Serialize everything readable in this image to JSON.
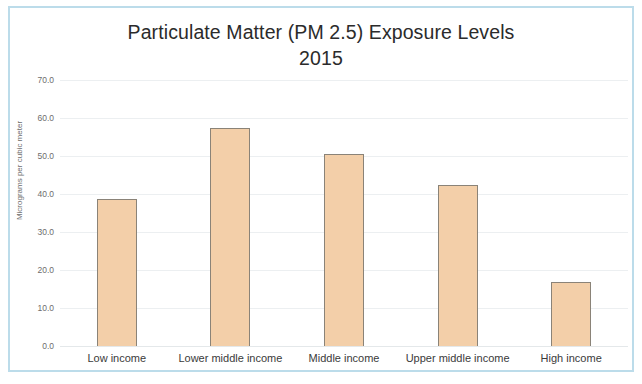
{
  "chart_data": {
    "type": "bar",
    "title": "Particulate Matter (PM  2.5) Exposure Levels",
    "subtitle": "2015",
    "categories": [
      "Low income",
      "Lower middle income",
      "Middle income",
      "Upper middle income",
      "High income"
    ],
    "values": [
      38.8,
      57.5,
      50.5,
      42.3,
      16.8
    ],
    "xlabel": "",
    "ylabel": "Micrograms per cubic meter",
    "ylim": [
      0.0,
      70.0
    ],
    "y_ticks": [
      "0.0",
      "10.0",
      "20.0",
      "30.0",
      "40.0",
      "50.0",
      "60.0",
      "70.0"
    ],
    "y_tick_values": [
      0,
      10,
      20,
      30,
      40,
      50,
      60,
      70
    ],
    "grid": true,
    "legend": false,
    "bar_color": "#f3cfa9",
    "bar_border_color": "#8a8378",
    "gridline_color": "#eceff1",
    "frame_border_color": "#bcdcea",
    "background_color": "#ffffff"
  }
}
